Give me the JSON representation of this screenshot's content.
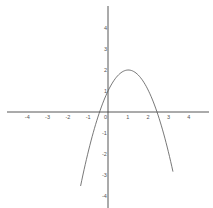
{
  "chart_data": {
    "type": "line",
    "title": "",
    "xlabel": "",
    "ylabel": "",
    "function": "y = -x^2 + 2x + 1",
    "vertex": [
      1,
      2
    ],
    "x_intercepts": [
      -0.41,
      2.41
    ],
    "y_intercept": 1,
    "xlim": [
      -5,
      5
    ],
    "ylim": [
      -5,
      5
    ],
    "grid": false,
    "legend": null,
    "x_tick_labels": [
      "-4",
      "-3",
      "-2",
      "-1",
      "0",
      "1",
      "2",
      "3",
      "4"
    ],
    "y_tick_labels": [
      "4",
      "3",
      "2",
      "1",
      "-1",
      "-2",
      "-3",
      "-4"
    ],
    "series": [
      {
        "name": "parabola",
        "x": [
          -1.35,
          -1.0,
          -0.5,
          0.0,
          0.5,
          1.0,
          1.5,
          2.0,
          2.5,
          3.0,
          3.2
        ],
        "y": [
          -3.52,
          -2.0,
          -0.25,
          1.0,
          1.75,
          2.0,
          1.75,
          1.0,
          -0.25,
          -2.0,
          -2.84
        ]
      }
    ],
    "colors": {
      "axis": "#444444",
      "curve": "#555555",
      "background": "#ffffff"
    }
  }
}
